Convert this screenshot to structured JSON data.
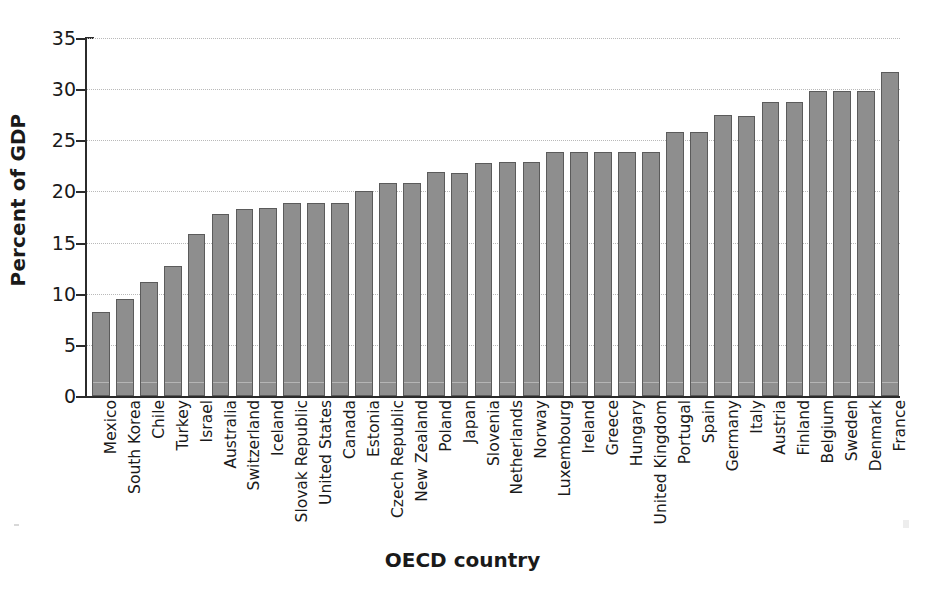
{
  "chart_data": {
    "type": "bar",
    "title": "",
    "xlabel": "OECD country",
    "ylabel": "Percent of GDP",
    "ylim": [
      0,
      35
    ],
    "yticks": [
      0,
      5,
      10,
      15,
      20,
      25,
      30,
      35
    ],
    "grid": "horizontal dotted",
    "legend": "none",
    "orientation": "vertical",
    "bar_color": "#8e8e8e",
    "bar_edge_color": "#5b5b5b",
    "categories": [
      "Mexico",
      "South Korea",
      "Chile",
      "Turkey",
      "Israel",
      "Australia",
      "Switzerland",
      "Iceland",
      "Slovak Republic",
      "United States",
      "Canada",
      "Estonia",
      "Czech Republic",
      "New Zealand",
      "Poland",
      "Japan",
      "Slovenia",
      "Netherlands",
      "Norway",
      "Luxembourg",
      "Ireland",
      "Greece",
      "Hungary",
      "United Kingdom",
      "Portugal",
      "Spain",
      "Germany",
      "Italy",
      "Austria",
      "Finland",
      "Belgium",
      "Sweden",
      "Denmark",
      "France"
    ],
    "values": [
      8.2,
      9.5,
      11.1,
      12.7,
      15.8,
      17.8,
      18.3,
      18.4,
      18.9,
      18.9,
      18.9,
      20.0,
      20.8,
      20.8,
      21.9,
      21.8,
      22.8,
      22.9,
      22.9,
      23.9,
      23.9,
      23.9,
      23.9,
      23.9,
      25.8,
      25.8,
      27.5,
      27.4,
      28.7,
      28.7,
      29.8,
      29.8,
      29.8,
      31.7
    ]
  }
}
